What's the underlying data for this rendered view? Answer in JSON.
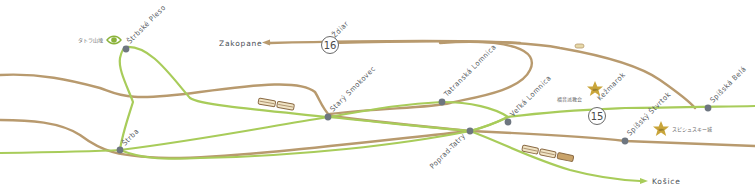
{
  "map": {
    "colors": {
      "road": "#b89a6e",
      "rail": "#a8cc5a",
      "station": "#6e7680",
      "star": "#c9a53a",
      "eye": "#8bb33a"
    },
    "stations": [
      {
        "id": "strbske-pleso",
        "name": "Štrbské Pleso"
      },
      {
        "id": "strba",
        "name": "Štrba"
      },
      {
        "id": "stary-smokovec",
        "name": "Starý Smokovec"
      },
      {
        "id": "tatranska-lomnica",
        "name": "Tatranská Lomnica"
      },
      {
        "id": "velka-lomnica",
        "name": "Veľká Lomnica"
      },
      {
        "id": "poprad-tatry",
        "name": "Poprad-Tatry"
      },
      {
        "id": "spissky-stvrtok",
        "name": "Spišský Štvrtok"
      },
      {
        "id": "spisska-bela",
        "name": "Spišská Belá"
      }
    ],
    "towns": [
      {
        "id": "kezmarok",
        "name": "Kežmarok"
      },
      {
        "id": "zdiar",
        "name": "Ždiar"
      }
    ],
    "destinations": [
      {
        "id": "zakopane",
        "name": "Zakopane"
      },
      {
        "id": "kosice",
        "name": "Košice"
      }
    ],
    "route_numbers": [
      {
        "id": "route-16",
        "label": "16"
      },
      {
        "id": "route-15",
        "label": "15"
      }
    ],
    "points_of_interest": [
      {
        "id": "tatra-viewpoint",
        "label": "タトラ山塊",
        "icon": "eye-icon"
      },
      {
        "id": "evangelical-church",
        "label": "福音派教会",
        "icon": "world-heritage-star-icon",
        "badge": "WH"
      },
      {
        "id": "spis-castle",
        "label": "スピシュスキー城",
        "icon": "world-heritage-star-icon",
        "badge": "WH"
      }
    ]
  }
}
